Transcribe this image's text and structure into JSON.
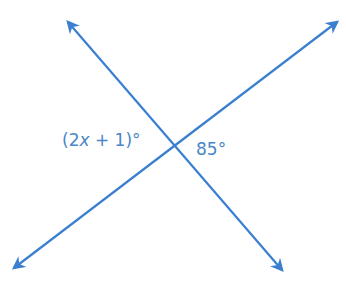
{
  "diagram": {
    "type": "intersecting-lines",
    "line_color": "#3a7fd0",
    "label_color": "#4a86c8",
    "intersection": {
      "x": 175,
      "y": 145
    },
    "lines": [
      {
        "name": "line-a",
        "from": {
          "x": 68,
          "y": 22
        },
        "to": {
          "x": 282,
          "y": 270
        }
      },
      {
        "name": "line-b",
        "from": {
          "x": 14,
          "y": 268
        },
        "to": {
          "x": 337,
          "y": 22
        }
      }
    ],
    "labels": {
      "left_angle": {
        "prefix": "(2",
        "variable": "x",
        "suffix": " + 1)°"
      },
      "right_angle": "85°"
    }
  }
}
